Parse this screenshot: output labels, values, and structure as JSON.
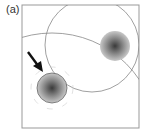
{
  "panel": {
    "label": "(a)",
    "frame": {
      "x": 22,
      "y": 5,
      "width": 117,
      "height": 123,
      "stroke": "#999999"
    },
    "arcs": [
      {
        "name": "large-arc",
        "cx": 52,
        "cy": 138,
        "r": 106
      },
      {
        "name": "corner-arc",
        "cx": 95,
        "cy": 50,
        "r": 46
      }
    ],
    "spots": [
      {
        "name": "target-spot",
        "cx": 52,
        "cy": 88,
        "r": 15
      },
      {
        "name": "upper-spot",
        "cx": 115,
        "cy": 46,
        "r": 15
      }
    ],
    "arrow": {
      "x1": 28,
      "y1": 52,
      "x2": 42,
      "y2": 71,
      "color": "#111111"
    }
  }
}
